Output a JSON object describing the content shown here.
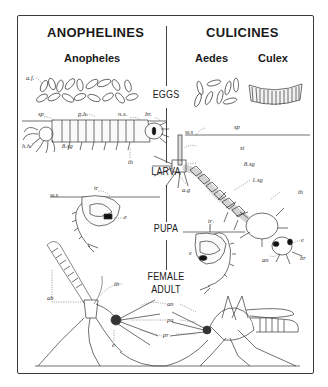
{
  "groups": {
    "left": {
      "title": "ANOPHELINES",
      "genera": [
        "Anopheles"
      ]
    },
    "right": {
      "title": "CULICINES",
      "genera": [
        "Aedes",
        "Culex"
      ]
    }
  },
  "stages": {
    "eggs": "EGGS",
    "larva": "LARVA",
    "pupa": "PUPA",
    "adult_line1": "FEMALE",
    "adult_line2": "ADULT"
  },
  "labels": {
    "af": "a.f.",
    "sp_left": "sp",
    "ph": "p.h.",
    "ns": "n.s.",
    "br_left": "br.",
    "hh": "h.h",
    "sg8_left": "8.sg",
    "th_left": "th",
    "ws_right_larva": "w.s",
    "sp_right": "sp",
    "st": "st",
    "sg8_right": "8.sg",
    "ag": "a.g",
    "sg1": "1.sg",
    "th_right": "th",
    "e_right_larva": "e",
    "an_larva": "an",
    "br_right": "br",
    "ws_left_pupa": "w.s",
    "tr_left": "tr",
    "e_left_pupa": "e",
    "tr_right": "tr",
    "e_right_pupa": "e",
    "th_adult": "th",
    "ab": "ab",
    "e_adult": "e",
    "an_adult": "an",
    "pa": "pa",
    "pr": "pr"
  },
  "colors": {
    "ink": "#1a1a1a",
    "line": "#555555",
    "paper": "#ffffff"
  }
}
